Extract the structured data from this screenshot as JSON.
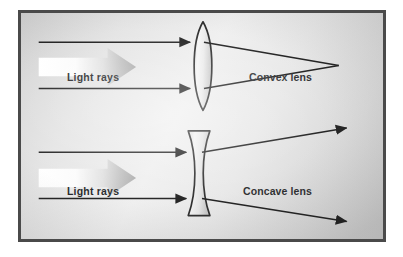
{
  "figure": {
    "background_color": "#e2e2e2",
    "frame_color": "#4a4a4a",
    "ink_color": "#111111"
  },
  "panels": [
    {
      "id": "convex",
      "lens_name": "convex-lens",
      "lens_label": "Convex lens",
      "lens_shape": "biconvex",
      "rays_label": "Light  rays",
      "behavior": "converging",
      "incoming_ray_count": 2,
      "outgoing_ray_count": 2,
      "focal_point": {
        "x": 341,
        "y": 64
      }
    },
    {
      "id": "concave",
      "lens_name": "concave-lens",
      "lens_label": "Concave lens",
      "lens_shape": "biconcave",
      "rays_label": "Light  rays",
      "behavior": "diverging",
      "incoming_ray_count": 2,
      "outgoing_ray_count": 2,
      "focal_point": null
    }
  ],
  "icons": {
    "block_arrow": "block-arrow-right-icon",
    "ray_arrowhead": "arrowhead-right-icon"
  },
  "colors": {
    "lens_fill_light": "#f2f2f2",
    "lens_fill_dark": "#c9c9c9",
    "lens_stroke": "#1a1a1a",
    "block_arrow_light": "#ffffff",
    "block_arrow_dark": "#a8a8a8",
    "ray_stroke": "#0d0d0d"
  }
}
